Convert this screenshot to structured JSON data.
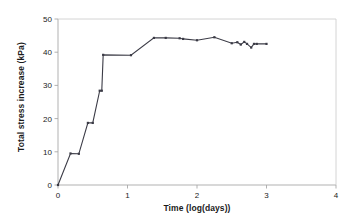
{
  "chart_data": {
    "type": "line",
    "title": "",
    "subtitle": "",
    "xlabel": "Time (log(days))",
    "ylabel": "Total stress increase (kPa)",
    "xlim": [
      0,
      4
    ],
    "ylim": [
      0,
      50
    ],
    "xticks": [
      0,
      1,
      2,
      3,
      4
    ],
    "yticks": [
      0,
      10,
      20,
      30,
      40,
      50
    ],
    "xtick_labels": [
      "0",
      "1",
      "2",
      "3",
      "4"
    ],
    "ytick_labels": [
      "0",
      "10",
      "20",
      "30",
      "40",
      "50"
    ],
    "grid": false,
    "legend": null,
    "legend_position": "none",
    "marker": "square",
    "line_color": "#3b3b46",
    "marker_color": "#3b3b46",
    "axis_color": "#a8a8a8",
    "text_color": "#1a1a1a",
    "background": "#ffffff",
    "series": [
      {
        "name": "Total stress increase",
        "x": [
          0.0,
          0.18,
          0.3,
          0.43,
          0.5,
          0.6,
          0.63,
          0.65,
          1.05,
          1.38,
          1.55,
          1.75,
          1.8,
          2.0,
          2.25,
          2.5,
          2.58,
          2.63,
          2.68,
          2.72,
          2.78,
          2.82,
          2.86,
          3.0
        ],
        "y": [
          0.0,
          9.5,
          9.4,
          18.7,
          18.7,
          28.4,
          28.4,
          39.2,
          39.1,
          44.3,
          44.3,
          44.2,
          44.0,
          43.6,
          44.5,
          42.7,
          43.0,
          42.3,
          43.1,
          42.5,
          41.4,
          42.5,
          42.5,
          42.5
        ]
      }
    ],
    "annotations": []
  },
  "axes": {
    "x_title": "Time (log(days))",
    "y_title": "Total stress increase (kPa)"
  }
}
